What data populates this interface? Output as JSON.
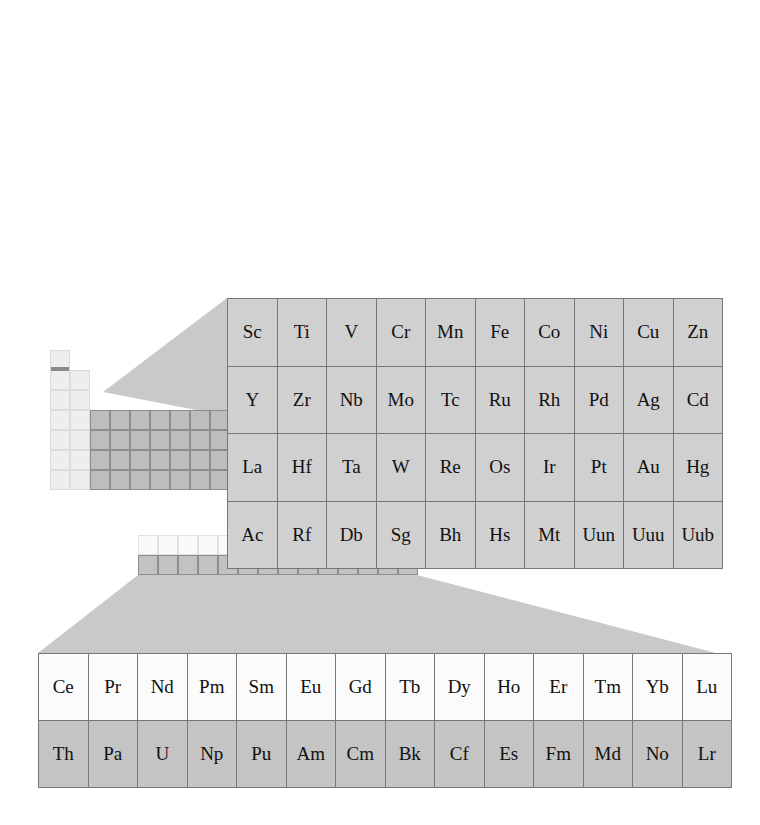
{
  "figure": {
    "kind": "periodic-table-callout-diagram",
    "background_color": "#ffffff",
    "connector_fill": "#c9c9c9",
    "detail_cell_fill_gray": "#d0d0d0",
    "detail_cell_fill_light": "#fbfbfb",
    "detail_cell_fill_dark": "#c4c4c4",
    "detail_border_color": "#777777",
    "stair_line_color": "#8a8a8a"
  },
  "detail_top": {
    "name": "transition-metal-block-detail",
    "columns": 10,
    "rows": 4,
    "cells": [
      [
        "Sc",
        "Ti",
        "V",
        "Cr",
        "Mn",
        "Fe",
        "Co",
        "Ni",
        "Cu",
        "Zn"
      ],
      [
        "Y",
        "Zr",
        "Nb",
        "Mo",
        "Tc",
        "Ru",
        "Rh",
        "Pd",
        "Ag",
        "Cd"
      ],
      [
        "La",
        "Hf",
        "Ta",
        "W",
        "Re",
        "Os",
        "Ir",
        "Pt",
        "Au",
        "Hg"
      ],
      [
        "Ac",
        "Rf",
        "Db",
        "Sg",
        "Bh",
        "Hs",
        "Mt",
        "Uun",
        "Uuu",
        "Uub"
      ]
    ]
  },
  "detail_bottom": {
    "name": "f-block-detail",
    "columns": 14,
    "rows": 2,
    "cells": [
      [
        "Ce",
        "Pr",
        "Nd",
        "Pm",
        "Sm",
        "Eu",
        "Gd",
        "Tb",
        "Dy",
        "Ho",
        "Er",
        "Tm",
        "Yb",
        "Lu"
      ],
      [
        "Th",
        "Pa",
        "U",
        "Np",
        "Pu",
        "Am",
        "Cm",
        "Bk",
        "Cf",
        "Es",
        "Fm",
        "Md",
        "No",
        "Lr"
      ]
    ]
  },
  "mini_table": {
    "name": "mini-periodic-table",
    "cell_size_px": 20,
    "origin": {
      "x": 50,
      "y": 350
    },
    "blocks": [
      {
        "name": "s-block",
        "columns": 2,
        "rows": 7,
        "style": "pale"
      },
      {
        "name": "d-block",
        "columns": 10,
        "rows": 4,
        "style": "dark"
      },
      {
        "name": "p-block",
        "columns": 6,
        "rows": 6,
        "style": "mid"
      },
      {
        "name": "f-block-strip",
        "columns": 14,
        "rows": 2,
        "style": "light-over-dark"
      }
    ],
    "metalloid_stair_visible": true,
    "highlight_row_visible": true
  }
}
